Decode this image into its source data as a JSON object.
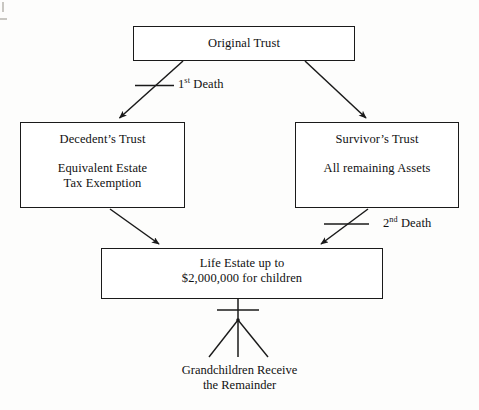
{
  "diagram": {
    "type": "flowchart",
    "nodes": [
      {
        "id": "original-trust",
        "title": "Original Trust",
        "subtitle": ""
      },
      {
        "id": "decedents-trust",
        "title": "Decedent’s Trust",
        "subtitle": "Equivalent Estate\nTax Exemption"
      },
      {
        "id": "survivors-trust",
        "title": "Survivor’s Trust",
        "subtitle": "All remaining Assets"
      },
      {
        "id": "life-estate",
        "title": "Life Estate up to",
        "subtitle": "$2,000,000 for children"
      }
    ],
    "edge_labels": {
      "first_death_number": "1",
      "first_death_ordinal": "st",
      "first_death_word": " Death",
      "second_death_number": "2",
      "second_death_ordinal": "nd",
      "second_death_word": " Death"
    },
    "terminal": {
      "text": "Grandchildren Receive\nthe Remainder"
    },
    "colors": {
      "stroke": "#1a1a1a",
      "text": "#111111",
      "background": "#fdfdfc",
      "box_fill": "#ffffff",
      "frame_mark": "#c9c7c2"
    }
  }
}
